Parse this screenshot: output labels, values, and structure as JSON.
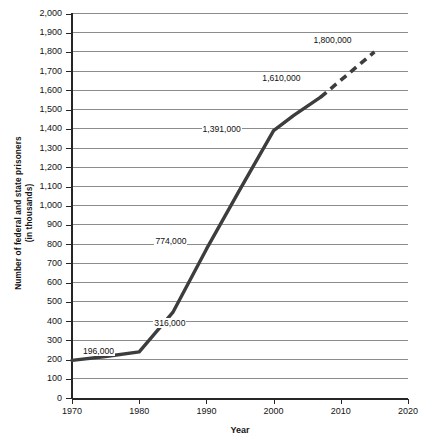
{
  "chart_data": {
    "type": "line",
    "title": "",
    "xlabel": "Year",
    "ylabel_lines": [
      "Number of federal and state prisoners",
      "(in thousands)"
    ],
    "ylabel": "Number of federal and state prisoners (in thousands)",
    "xlim": [
      1970,
      2020
    ],
    "ylim": [
      0,
      2000
    ],
    "xticks": [
      1970,
      1980,
      1990,
      2000,
      2010,
      2020
    ],
    "xtick_labels": [
      "1970",
      "1980",
      "1990",
      "2000",
      "2010",
      "2020"
    ],
    "yticks": [
      0,
      100,
      200,
      300,
      400,
      500,
      600,
      700,
      800,
      900,
      1000,
      1100,
      1200,
      1300,
      1400,
      1500,
      1600,
      1700,
      1800,
      1900,
      2000
    ],
    "ytick_labels": [
      "0",
      "100",
      "200",
      "300",
      "400",
      "500",
      "600",
      "700",
      "800",
      "900",
      "1,000",
      "1,100",
      "1,200",
      "1,300",
      "1,400",
      "1,500",
      "1,600",
      "1,700",
      "1,800",
      "1,900",
      "2,000"
    ],
    "grid": true,
    "legend": "none",
    "series": [
      {
        "name": "Actual (solid)",
        "style": "solid",
        "x": [
          1970,
          1975,
          1980,
          1985,
          1990,
          1995,
          2000,
          2003,
          2007
        ],
        "values": [
          196,
          216,
          240,
          445,
          774,
          1085,
          1391,
          1470,
          1565
        ]
      },
      {
        "name": "Projected (dashed)",
        "style": "dashed",
        "x": [
          2007,
          2015
        ],
        "values": [
          1565,
          1800
        ]
      }
    ],
    "annotations": [
      {
        "label": "196,000",
        "x": 1970,
        "value": 196
      },
      {
        "label": "316,000",
        "x": 1983,
        "value": 316
      },
      {
        "label": "774,000",
        "x": 1990,
        "value": 774
      },
      {
        "label": "1,391,000",
        "x": 2000,
        "value": 1391
      },
      {
        "label": "1,610,000",
        "x": 2008,
        "value": 1610
      },
      {
        "label": "1,800,000",
        "x": 2015,
        "value": 1800
      }
    ],
    "colors": {
      "line": "#3d3d3d",
      "grid": "#8c8c8c",
      "axis": "#262626",
      "text": "#141414",
      "background": "#ffffff"
    }
  }
}
